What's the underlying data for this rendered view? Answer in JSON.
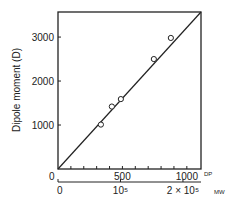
{
  "chart_data": {
    "type": "scatter",
    "title": "",
    "ylabel": "Dipole moment (D)",
    "xlabel": "DP",
    "x2label": "MW",
    "xlim": [
      0,
      1110
    ],
    "ylim": [
      0,
      3570
    ],
    "x_ticks": [
      0,
      100,
      200,
      300,
      400,
      500,
      600,
      700,
      800,
      900,
      1000
    ],
    "x_tick_labels": [
      {
        "value": 0,
        "label": "0"
      },
      {
        "value": 500,
        "label": "500"
      },
      {
        "value": 1000,
        "label": "1000"
      }
    ],
    "y_ticks": [
      1000,
      2000,
      3000
    ],
    "y_tick_labels": [
      {
        "value": 1000,
        "label": "1000"
      },
      {
        "value": 2000,
        "label": "2000"
      },
      {
        "value": 3000,
        "label": "3000"
      }
    ],
    "x2_ticks": [
      {
        "mw": 0,
        "dp": 0,
        "label": "0"
      },
      {
        "mw": 100000,
        "dp": 485,
        "label": "10⁵"
      },
      {
        "mw": 200000,
        "dp": 970,
        "label": "2 × 10⁵"
      }
    ],
    "grid": false,
    "legend": "none",
    "series": [
      {
        "name": "measured",
        "marker": "open-circle",
        "points": [
          {
            "x": 333,
            "y": 1010
          },
          {
            "x": 418,
            "y": 1420
          },
          {
            "x": 488,
            "y": 1590
          },
          {
            "x": 744,
            "y": 2500
          },
          {
            "x": 876,
            "y": 2980
          }
        ]
      }
    ],
    "fit_line": {
      "x": [
        0,
        1110
      ],
      "y": [
        0,
        3570
      ]
    }
  }
}
